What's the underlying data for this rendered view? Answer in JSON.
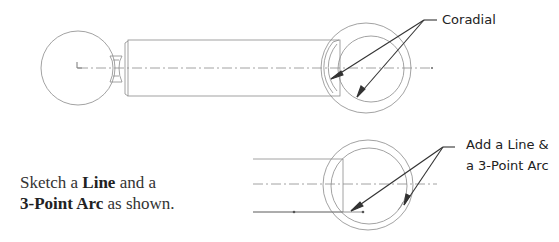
{
  "callouts": {
    "top": {
      "label": "Coradial"
    },
    "bottom": {
      "line1": "Add a Line &",
      "line2": "a 3-Point Arc"
    }
  },
  "instruction": {
    "part1": "Sketch a ",
    "bold1": "Line",
    "part2": " and a",
    "bold2": "3-Point Arc",
    "part3": " as shown."
  },
  "colors": {
    "stroke": "#7a7a7a",
    "leader": "#333333",
    "text": "#222222"
  }
}
